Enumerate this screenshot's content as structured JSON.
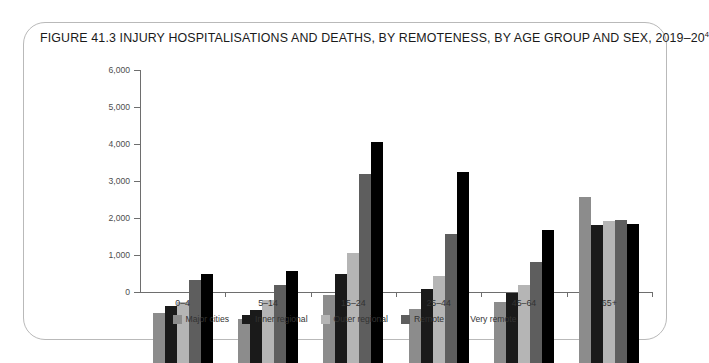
{
  "figure": {
    "title": "FIGURE 41.3 INJURY HOSPITALISATIONS AND DEATHS, BY REMOTENESS, BY AGE GROUP AND SEX, 2019–20",
    "title_superscript": "4"
  },
  "chart_data": {
    "type": "bar",
    "title": "FIGURE 41.3 INJURY HOSPITALISATIONS AND DEATHS, BY REMOTENESS, BY AGE GROUP AND SEX, 2019–20",
    "xlabel": "",
    "ylabel": "",
    "ylim": [
      0,
      6000
    ],
    "yticks": [
      0,
      1000,
      2000,
      3000,
      4000,
      5000,
      6000
    ],
    "ytick_labels": [
      "0",
      "1,000",
      "2,000",
      "3,000",
      "4,000",
      "5,000",
      "6,000"
    ],
    "grid": false,
    "legend_position": "bottom",
    "categories": [
      "0–4",
      "5–14",
      "15–24",
      "25–44",
      "45–64",
      "65+"
    ],
    "series": [
      {
        "name": "Major cities",
        "color": "#8c8c8c",
        "values": [
          1350,
          1180,
          1830,
          1450,
          1650,
          4480
        ]
      },
      {
        "name": "Inner regional",
        "color": "#1a1a1a",
        "values": [
          1550,
          1430,
          2400,
          2000,
          1880,
          3720
        ]
      },
      {
        "name": "Outer regional",
        "color": "#b5b5b5",
        "values": [
          1650,
          1700,
          2960,
          2350,
          2120,
          3830
        ]
      },
      {
        "name": "Remote",
        "color": "#5e5e5e",
        "values": [
          2250,
          2100,
          5100,
          3500,
          2730,
          3870
        ]
      },
      {
        "name": "Very remote",
        "color": "#000000",
        "values": [
          2400,
          2500,
          5960,
          5150,
          3600,
          3760
        ]
      }
    ]
  }
}
